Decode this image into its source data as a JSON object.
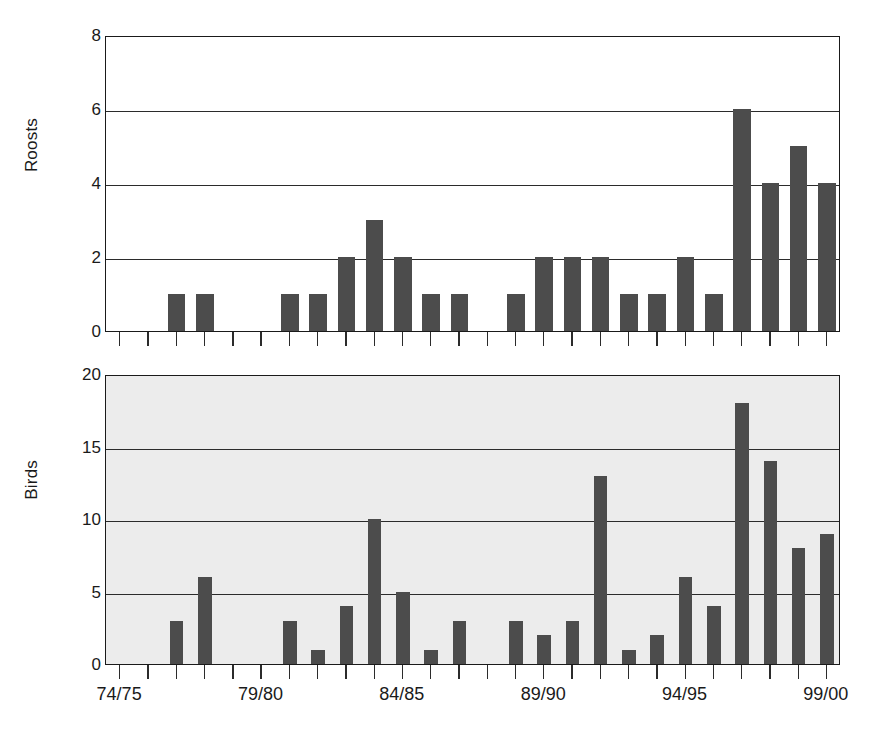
{
  "chart_data": [
    {
      "type": "bar",
      "id": "roosts",
      "title": "",
      "xlabel": "",
      "ylabel": "Roosts",
      "ylim": [
        0,
        8
      ],
      "yticks": [
        0,
        2,
        4,
        6,
        8
      ],
      "ytick_labels": [
        "0",
        "2",
        "4",
        "6",
        "8"
      ],
      "grid": true,
      "grid_axis": "y",
      "plot_background": "#ffffff",
      "bar_color": "#4c4c4c",
      "bar_width_fraction": 0.62,
      "categories": [
        "74/75",
        "75/76",
        "76/77",
        "77/78",
        "78/79",
        "79/80",
        "80/81",
        "81/82",
        "82/83",
        "83/84",
        "84/85",
        "85/86",
        "86/87",
        "87/88",
        "88/89",
        "89/90",
        "90/91",
        "91/92",
        "92/93",
        "93/94",
        "94/95",
        "95/96",
        "96/97",
        "97/98",
        "98/99",
        "99/00"
      ],
      "values": [
        0,
        0,
        1,
        1,
        0,
        0,
        1,
        1,
        2,
        3,
        2,
        1,
        1,
        0,
        1,
        2,
        2,
        2,
        1,
        1,
        2,
        1,
        6,
        4,
        5,
        4
      ],
      "xtick_labels": [
        "74/75",
        "79/80",
        "84/85",
        "89/90",
        "94/95",
        "99/00"
      ],
      "xtick_label_categories": [
        "74/75",
        "79/80",
        "84/85",
        "89/90",
        "94/95",
        "99/00"
      ]
    },
    {
      "type": "bar",
      "id": "birds",
      "title": "",
      "xlabel": "",
      "ylabel": "Birds",
      "ylim": [
        0,
        20
      ],
      "yticks": [
        0,
        5,
        10,
        15,
        20
      ],
      "ytick_labels": [
        "0",
        "5",
        "10",
        "15",
        "20"
      ],
      "grid": true,
      "grid_axis": "y",
      "plot_background": "#ececec",
      "bar_color": "#4c4c4c",
      "bar_width_fraction": 0.48,
      "categories": [
        "74/75",
        "75/76",
        "76/77",
        "77/78",
        "78/79",
        "79/80",
        "80/81",
        "81/82",
        "82/83",
        "83/84",
        "84/85",
        "85/86",
        "86/87",
        "87/88",
        "88/89",
        "89/90",
        "90/91",
        "91/92",
        "92/93",
        "93/94",
        "94/95",
        "95/96",
        "96/97",
        "97/98",
        "98/99",
        "99/00"
      ],
      "values": [
        0,
        0,
        3,
        6,
        0,
        0,
        3,
        1,
        4,
        10,
        5,
        1,
        3,
        0,
        3,
        2,
        3,
        13,
        1,
        2,
        6,
        4,
        18,
        14,
        8,
        9
      ],
      "xtick_labels": [
        "74/75",
        "79/80",
        "84/85",
        "89/90",
        "94/95",
        "99/00"
      ],
      "xtick_label_categories": [
        "74/75",
        "79/80",
        "84/85",
        "89/90",
        "94/95",
        "99/00"
      ]
    }
  ],
  "axes": {
    "roosts": {
      "ylabel": "Roosts",
      "ytick_labels": [
        "0",
        "2",
        "4",
        "6",
        "8"
      ]
    },
    "birds": {
      "ylabel": "Birds",
      "ytick_labels": [
        "0",
        "5",
        "10",
        "15",
        "20"
      ]
    }
  },
  "xaxis": {
    "labels": [
      "74/75",
      "79/80",
      "84/85",
      "89/90",
      "94/95",
      "99/00"
    ]
  },
  "colors": {
    "bar": "#4c4c4c",
    "axis": "#1a1a1a",
    "grid": "#2b2b2b",
    "panel1_background": "#ffffff",
    "panel2_background": "#ececec",
    "page_background": "#ffffff"
  }
}
